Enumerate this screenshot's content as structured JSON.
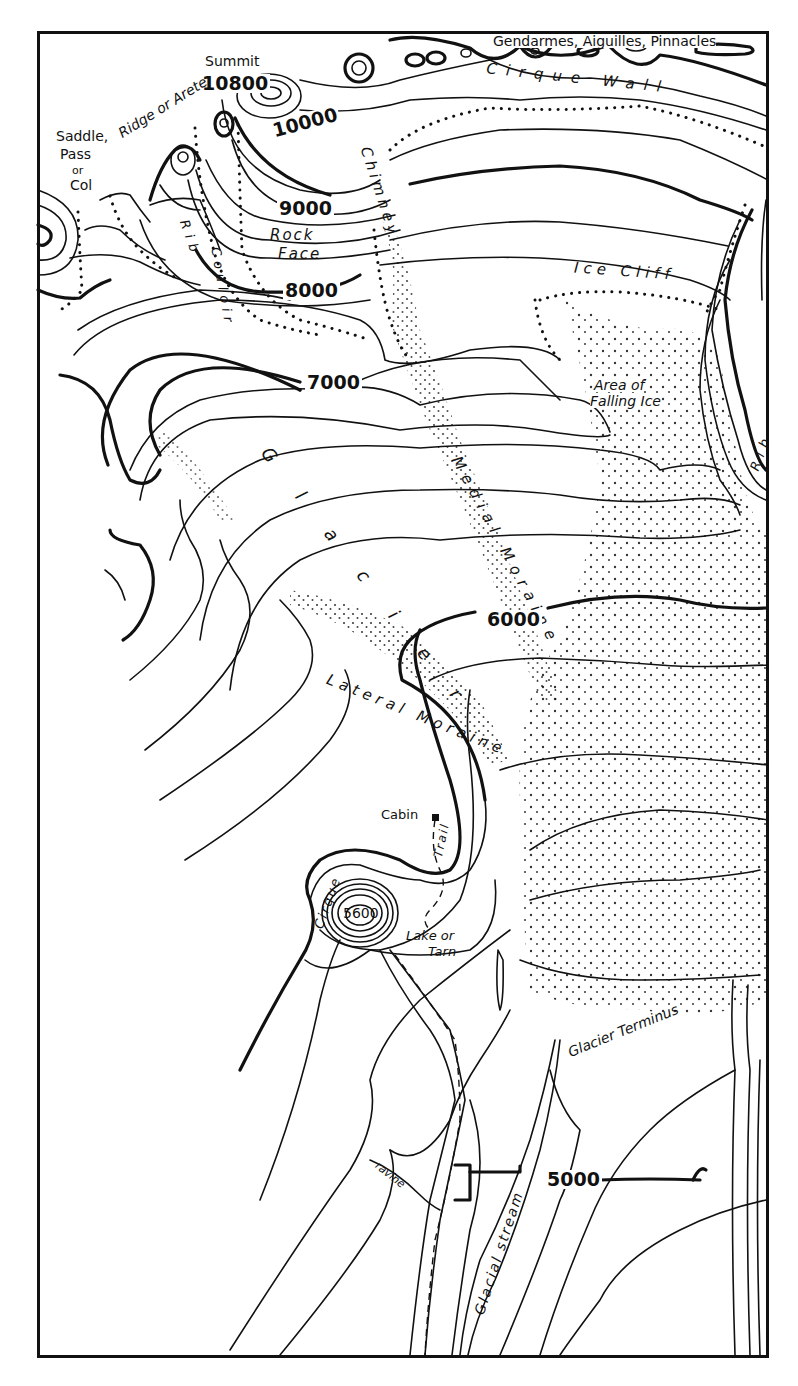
{
  "map": {
    "title": "Glacier and alpine landforms topographic sketch",
    "colors": {
      "ink": "#111111",
      "paper": "#ffffff"
    },
    "elevation_labels": [
      {
        "id": "summit",
        "text": "10800",
        "x": 203,
        "y": 74
      },
      {
        "id": "c10000",
        "text": "10000",
        "x": 271,
        "y": 116
      },
      {
        "id": "c9000",
        "text": "9000",
        "x": 279,
        "y": 202
      },
      {
        "id": "c8000",
        "text": "8000",
        "x": 284,
        "y": 283
      },
      {
        "id": "c7000",
        "text": "7000",
        "x": 306,
        "y": 377
      },
      {
        "id": "c6000",
        "text": "6000",
        "x": 486,
        "y": 614
      },
      {
        "id": "c5000",
        "text": "5000",
        "x": 546,
        "y": 1176
      },
      {
        "id": "knob",
        "text": "5600",
        "x": 340,
        "y": 909
      }
    ],
    "feature_labels": {
      "summit": "Summit",
      "saddle": [
        "Saddle,",
        "Pass",
        "or",
        "Col"
      ],
      "ridge": "Ridge or Arete",
      "gendarmes": "Gendarmes, Aiguilles, Pinnacles",
      "cirque_wall": "Cirque Wall",
      "chimney": "Chimney",
      "rock_face": [
        "Rock",
        "Face"
      ],
      "couloir": "Couloir",
      "rib_left": "Rib",
      "rib_right": "Rib",
      "ice_cliff": "Ice Cliff",
      "falling_ice": [
        "Area of",
        "Falling Ice"
      ],
      "glacier": "G l a c i e r",
      "medial_moraine": "Medial Moraine",
      "lateral_moraine": "Lateral Moraine",
      "cabin": "Cabin",
      "trail": "Trail",
      "cirque": "Cirque",
      "lake": [
        "Lake or",
        "Tarn"
      ],
      "glacier_terminus": "Glacier Terminus",
      "ravine": "ravine",
      "glacial_stream": "Glacial stream"
    }
  }
}
